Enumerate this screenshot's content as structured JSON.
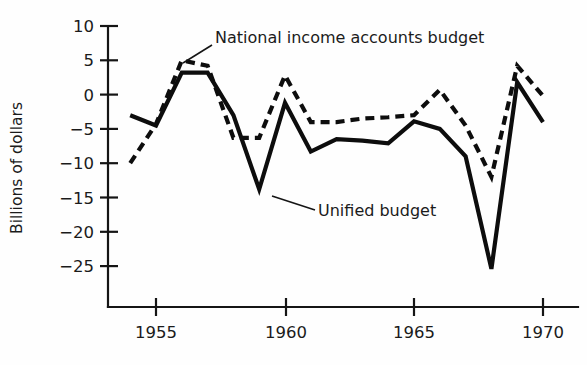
{
  "chart_data": {
    "type": "line",
    "title": "",
    "xlabel": "",
    "ylabel": "Billions of dollars",
    "xlim": [
      1953.1,
      1970.6
    ],
    "ylim": [
      -27.5,
      11
    ],
    "grid": false,
    "legend_position": "inline-annotations",
    "x_ticks": [
      "1955",
      "1960",
      "1965",
      "1970"
    ],
    "x_tick_values": [
      1955,
      1960,
      1965,
      1970
    ],
    "y_ticks": [
      "10",
      "5",
      "0",
      "−5",
      "−10",
      "−15",
      "−20",
      "−25"
    ],
    "y_tick_values": [
      10,
      5,
      0,
      -5,
      -10,
      -15,
      -20,
      -25
    ],
    "x": [
      1954,
      1955,
      1956,
      1957,
      1958,
      1959,
      1960,
      1961,
      1962,
      1963,
      1964,
      1965,
      1966,
      1967,
      1968,
      1969,
      1970
    ],
    "series": [
      {
        "name": "National income accounts budget",
        "style": "dashed",
        "values": [
          -10.0,
          -4.3,
          5.0,
          4.2,
          -6.3,
          -6.3,
          2.8,
          -4.0,
          -4.0,
          -3.5,
          -3.3,
          -3.0,
          0.7,
          -4.5,
          -12.0,
          4.2,
          -0.2
        ]
      },
      {
        "name": "Unified budget",
        "style": "solid",
        "values": [
          -3.0,
          -4.5,
          3.2,
          3.2,
          -3.0,
          -13.8,
          -1.2,
          -8.3,
          -6.5,
          -6.7,
          -7.1,
          -3.9,
          -5.0,
          -9.0,
          -25.4,
          1.8,
          -4.0
        ]
      }
    ],
    "annotations": [
      {
        "label": "National income accounts budget",
        "points_to_series": "National income accounts budget",
        "points_to_x": 1956
      },
      {
        "label": "Unified budget",
        "points_to_series": "Unified budget",
        "points_to_x": 1959.9
      }
    ]
  },
  "axis": {
    "y_label": "Billions of dollars"
  }
}
